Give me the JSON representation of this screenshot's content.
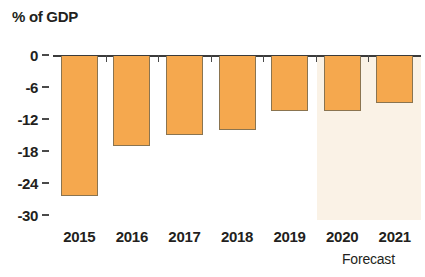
{
  "chart_data": {
    "type": "bar",
    "title": "% of GDP",
    "xlabel": "",
    "ylabel": "% of GDP",
    "categories": [
      "2015",
      "2016",
      "2017",
      "2018",
      "2019",
      "2020",
      "2021"
    ],
    "values": [
      -26.5,
      -17.0,
      -15.0,
      -14.0,
      -10.5,
      -10.5,
      -9.0
    ],
    "ylim": [
      -30,
      0
    ],
    "y_ticks": [
      "0",
      "-6",
      "-12",
      "-18",
      "-24",
      "-30"
    ],
    "y_tick_values": [
      0,
      -6,
      -12,
      -18,
      -24,
      -30
    ],
    "grid": false,
    "legend": null,
    "annotations": [
      {
        "text": "Forecast",
        "applies_to": [
          "2020",
          "2021"
        ]
      }
    ],
    "colors": {
      "bar_fill": "#f5a84e",
      "bar_outline": "#8a7450",
      "forecast_band": "#faf2e6",
      "axis": "#3b3b3b",
      "text": "#231f20",
      "background": "#ffffff"
    }
  }
}
